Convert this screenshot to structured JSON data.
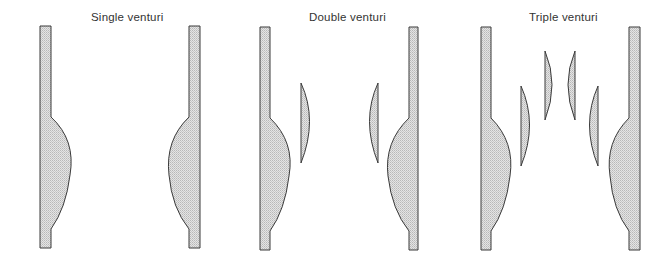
{
  "figure": {
    "panels": [
      {
        "id": "single",
        "title": "Single venturi",
        "inner_venturis": 0
      },
      {
        "id": "double",
        "title": "Double venturi",
        "inner_venturis": 1
      },
      {
        "id": "triple",
        "title": "Triple venturi",
        "inner_venturis": 2
      }
    ]
  },
  "colors": {
    "fill": "#d9d9d9",
    "stroke": "#3a3a3a",
    "text": "#333333",
    "background": "#ffffff"
  }
}
